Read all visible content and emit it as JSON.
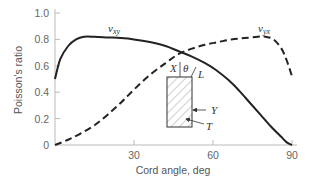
{
  "chart_data": {
    "type": "line",
    "title": "",
    "xlabel": "Cord angle, deg",
    "ylabel": "Poisson's ratio",
    "xlim": [
      0,
      90
    ],
    "ylim": [
      0,
      1.0
    ],
    "x_ticks": [
      0,
      30,
      60,
      90
    ],
    "x_tick_labels": [
      "",
      "30",
      "60",
      "90"
    ],
    "y_ticks": [
      0,
      0.2,
      0.4,
      0.6,
      0.8,
      1.0
    ],
    "y_tick_labels": [
      "0",
      "0.2",
      "0.4",
      "0.6",
      "0.8",
      "1.0"
    ],
    "grid": false,
    "series": [
      {
        "name": "v_xy",
        "label_main": "v",
        "label_sub": "xy",
        "style": "solid",
        "x": [
          0,
          2,
          5,
          8,
          11,
          15,
          20,
          25,
          30,
          36,
          42,
          47,
          52,
          57,
          61,
          66,
          70,
          74,
          78,
          82,
          86,
          88,
          90
        ],
        "y": [
          0.5,
          0.65,
          0.75,
          0.8,
          0.82,
          0.82,
          0.815,
          0.81,
          0.8,
          0.78,
          0.75,
          0.71,
          0.67,
          0.62,
          0.57,
          0.49,
          0.41,
          0.32,
          0.23,
          0.14,
          0.06,
          0.02,
          0.0
        ]
      },
      {
        "name": "v_yx",
        "label_main": "v",
        "label_sub": "yx",
        "style": "dashed",
        "x": [
          0,
          5,
          10,
          15,
          20,
          25,
          30,
          36,
          42,
          47,
          52,
          57,
          62,
          67,
          72,
          77,
          80,
          83,
          86,
          88,
          90
        ],
        "y": [
          0.0,
          0.04,
          0.09,
          0.15,
          0.23,
          0.32,
          0.42,
          0.53,
          0.62,
          0.69,
          0.73,
          0.76,
          0.78,
          0.8,
          0.81,
          0.82,
          0.82,
          0.8,
          0.73,
          0.64,
          0.52
        ]
      }
    ],
    "legend": "inline-labels",
    "inset": {
      "description": "hatched specimen with cord angle",
      "labels": {
        "x": "X",
        "theta": "θ",
        "l": "L",
        "y": "Y",
        "t": "T"
      }
    }
  }
}
